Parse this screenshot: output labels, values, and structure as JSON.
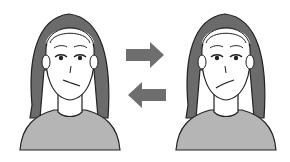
{
  "figure": {
    "left_face": {
      "expression": "mouth twisted to her right",
      "label": ""
    },
    "right_face": {
      "expression": "mouth twisted to her left",
      "label": ""
    },
    "arrows": [
      {
        "direction": "right",
        "icon": "arrow-right-icon"
      },
      {
        "direction": "left",
        "icon": "arrow-left-icon"
      }
    ],
    "colors": {
      "background": "#ffffff",
      "hair": "#6b6b6b",
      "skin": "#ffffff",
      "shirt": "#b5b5b5",
      "outline": "#222222",
      "arrow": "#6e6e6e"
    }
  }
}
